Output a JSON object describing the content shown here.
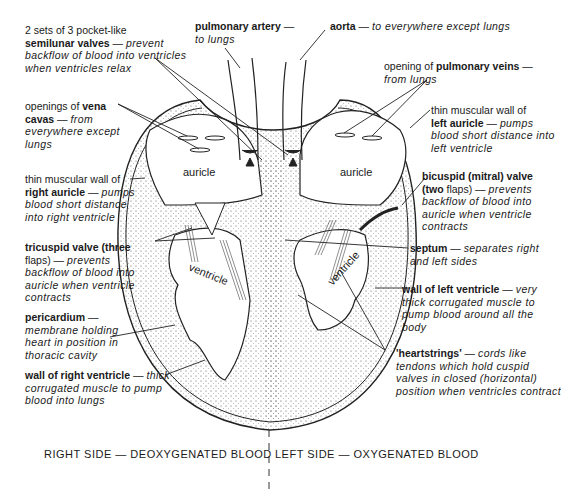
{
  "labels": {
    "semilunar": {
      "pre": "2 sets of 3 pocket-like",
      "bold": "semilunar valves",
      "dash": " — ",
      "desc": "prevent backflow of blood into ventricles when ventricles relax"
    },
    "pulmonary_artery": {
      "bold": "pulmonary artery",
      "dash": " —",
      "desc": "to lungs"
    },
    "aorta": {
      "bold": "aorta",
      "dash": " — ",
      "desc": "to everywhere except lungs"
    },
    "pulmonary_veins": {
      "pre": "opening of ",
      "bold": "pulmonary veins",
      "dash": " —",
      "desc": "from lungs"
    },
    "vena_cavas": {
      "pre": "openings of ",
      "bold": "vena cavas",
      "dash": " — ",
      "desc": "from everywhere except lungs"
    },
    "left_auricle_wall": {
      "pre": "thin muscular wall of",
      "bold": "left auricle",
      "dash": " — ",
      "desc": "pumps blood short distance into left ventricle"
    },
    "right_auricle_wall": {
      "pre": "thin muscular wall of",
      "bold": "right auricle",
      "dash": " — ",
      "desc": "pumps blood short distance into right ventricle"
    },
    "bicuspid": {
      "bold": "bicuspid (mitral) valve",
      "bold2": "(two",
      "post": " flaps)",
      "dash": " — ",
      "desc": "prevents backflow of blood into auricle when ventricle contracts"
    },
    "tricuspid": {
      "bold": "tricuspid valve (three",
      "post": "flaps)",
      "dash": " — ",
      "desc": "prevents backflow of blood into auricle when ventricle contracts"
    },
    "septum": {
      "bold": "septum",
      "dash": " — ",
      "desc": "separates right and left sides"
    },
    "pericardium": {
      "bold": "pericardium",
      "dash": " — ",
      "desc": "membrane holding heart in position in thoracic cavity"
    },
    "left_ventricle_wall": {
      "bold": "wall of left ventricle",
      "dash": " — ",
      "desc": "very thick corrugated muscle to pump blood around all the body"
    },
    "heartstrings": {
      "bold": "'heartstrings'",
      "dash": " — ",
      "desc": "cords like tendons which hold cuspid valves in closed (horizontal) position when ventricles contract"
    },
    "right_ventricle_wall": {
      "bold": "wall of right ventricle",
      "dash": " — ",
      "desc": "thick corrugated muscle to pump blood into lungs"
    }
  },
  "chambers": {
    "auricle_right": "auricle",
    "auricle_left": "auricle",
    "ventricle_right": "ventricle",
    "ventricle_left": "ventricle"
  },
  "footer": {
    "right_side": "RIGHT SIDE — DEOXYGENATED BLOOD",
    "left_side": "LEFT SIDE — OXYGENATED BLOOD"
  }
}
